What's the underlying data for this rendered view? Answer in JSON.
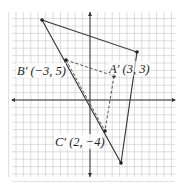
{
  "figure": {
    "type": "coordinate-plane-diagram",
    "grid": {
      "x_range": [
        -11,
        11
      ],
      "y_range": [
        -11,
        11
      ],
      "gridlines": true
    },
    "large_triangle": {
      "vertices": [
        [
          -7,
          11
        ],
        [
          6,
          7
        ],
        [
          4,
          -8
        ]
      ],
      "stroke": "#333333"
    },
    "image_triangle": {
      "style": "dashed",
      "points": {
        "A_prime": {
          "label": "A′",
          "coords": "(3, 3)",
          "xy": [
            3,
            3
          ]
        },
        "B_prime": {
          "label": "B′",
          "coords": "(−3, 5)",
          "xy": [
            -3,
            5
          ]
        },
        "C_prime": {
          "label": "C′",
          "coords": "(2, −4)",
          "xy": [
            2,
            -4
          ]
        }
      }
    },
    "labels": {
      "b_prime": "B′ (−3, 5)",
      "a_prime": "A′ (3, 3)",
      "c_prime": "C′ (2, −4)"
    }
  }
}
